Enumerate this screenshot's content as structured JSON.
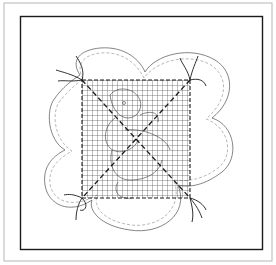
{
  "figure": {
    "description": "Line-art craft illustration: a square mesh grid basted over a flower-shaped fabric outline with a drawn figure, threads tied at the four grid corners",
    "elements": {
      "outer_border": "light gray outer frame",
      "inner_frame": "black rectangular frame",
      "flower_outline": "four-lobed flower shape with dashed stitching line inside edge",
      "mesh_grid": "square grid of fine lines with dashed border",
      "diagonal_basting": "two dashed diagonal lines forming an X across the grid",
      "corner_threads": "thread ends tied at each of the four grid corners",
      "figure_drawing": "faint outline drawing of a duck-like character beneath the grid"
    },
    "colors": {
      "ink": "#1a1a1a",
      "light_line": "#9a9a9a",
      "background": "#ffffff"
    }
  }
}
